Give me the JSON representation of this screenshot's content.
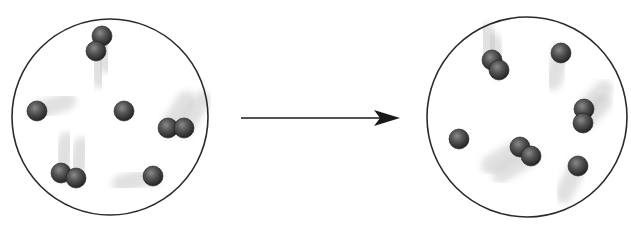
{
  "diagram": {
    "colors": {
      "background": "#ffffff",
      "container_outline": "#2a2a2a",
      "atom_fill_dark": "#2c2c2c",
      "atom_fill_mid": "#555555",
      "atom_highlight": "#8a8a8a",
      "trail": "#c8c8c8",
      "arrow": "#1a1a1a"
    },
    "containers": [
      {
        "id": "before",
        "cx": 110,
        "cy": 117,
        "r": 98,
        "particles": [
          {
            "type": "diatomic",
            "atoms": [
              [
                102,
                36
              ],
              [
                96,
                51
              ]
            ],
            "trail_dx": 4,
            "trail_dy": 28
          },
          {
            "type": "single",
            "atoms": [
              [
                37,
                111
              ]
            ],
            "trail_dx": 30,
            "trail_dy": -10
          },
          {
            "type": "single",
            "atoms": [
              [
                124,
                111
              ]
            ],
            "trail_dx": 0,
            "trail_dy": 30
          },
          {
            "type": "diatomic",
            "atoms": [
              [
                168,
                128
              ],
              [
                184,
                128
              ]
            ],
            "trail_dx": 18,
            "trail_dy": -28
          },
          {
            "type": "diatomic",
            "atoms": [
              [
                61,
                173
              ],
              [
                76,
                178
              ]
            ],
            "trail_dx": 6,
            "trail_dy": -32
          },
          {
            "type": "single",
            "atoms": [
              [
                153,
                176
              ]
            ],
            "trail_dx": -32,
            "trail_dy": 8
          }
        ]
      },
      {
        "id": "after",
        "cx": 527,
        "cy": 117,
        "r": 100,
        "particles": [
          {
            "type": "diatomic",
            "atoms": [
              [
                492,
                60
              ],
              [
                499,
                70
              ]
            ],
            "trail_dx": -6,
            "trail_dy": -28
          },
          {
            "type": "single",
            "atoms": [
              [
                561,
                53
              ]
            ],
            "trail_dx": -8,
            "trail_dy": 28
          },
          {
            "type": "single",
            "atoms": [
              [
                459,
                139
              ]
            ],
            "trail_dx": 0,
            "trail_dy": -30
          },
          {
            "type": "diatomic",
            "atoms": [
              [
                584,
                109
              ],
              [
                583,
                123
              ]
            ],
            "trail_dx": 20,
            "trail_dy": -20
          },
          {
            "type": "diatomic",
            "atoms": [
              [
                520,
                147
              ],
              [
                531,
                156
              ]
            ],
            "trail_dx": -30,
            "trail_dy": 18
          },
          {
            "type": "single",
            "atoms": [
              [
                578,
                166
              ]
            ],
            "trail_dx": -14,
            "trail_dy": 28
          }
        ]
      }
    ],
    "arrow": {
      "x1": 241,
      "y1": 118,
      "x2": 400,
      "y2": 118
    },
    "atom_radius": 10
  }
}
